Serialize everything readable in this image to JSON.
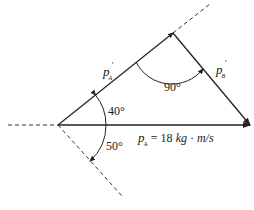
{
  "diagram": {
    "type": "vector-momentum-triangle",
    "colors": {
      "line": "#222222",
      "dashed": "#333333",
      "background": "#ffffff"
    },
    "labels": {
      "pA_prime": {
        "main": "p",
        "sub": "A",
        "sup": "′"
      },
      "pB_prime": {
        "main": "p",
        "sub": "B",
        "sup": "′"
      },
      "pA": {
        "main": "p",
        "sub": "A",
        "value": " = 18 ",
        "unit_kg": "kg",
        "dot": " · ",
        "unit_ms": "m/s"
      }
    },
    "angles": {
      "angle_top": "40°",
      "angle_bottom": "50°",
      "angle_right": "90°"
    }
  }
}
